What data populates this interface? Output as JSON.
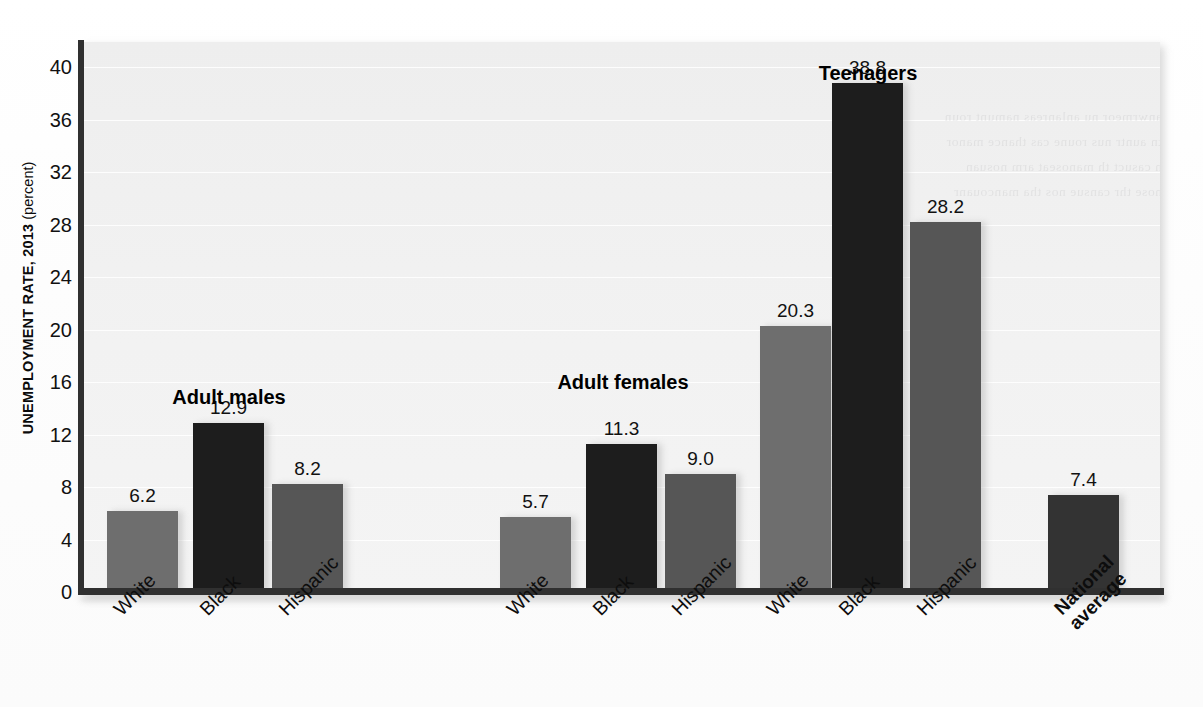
{
  "axis": {
    "y_title_strong": "UNEMPLOYMENT RATE, 2013",
    "y_title_light": " (percent)",
    "y_ticks": [
      "0",
      "4",
      "8",
      "12",
      "16",
      "20",
      "24",
      "28",
      "32",
      "36",
      "40"
    ]
  },
  "groups": [
    {
      "label": "Adult males"
    },
    {
      "label": "Adult females"
    },
    {
      "label": "Teenagers"
    },
    {
      "label": ""
    }
  ],
  "bars": [
    {
      "category": "White",
      "value": 6.2,
      "value_label": "6.2",
      "color": "#6e6e6e"
    },
    {
      "category": "Black",
      "value": 12.9,
      "value_label": "12.9",
      "color": "#1d1d1d"
    },
    {
      "category": "Hispanic",
      "value": 8.2,
      "value_label": "8.2",
      "color": "#565656"
    },
    {
      "category": "White",
      "value": 5.7,
      "value_label": "5.7",
      "color": "#6e6e6e"
    },
    {
      "category": "Black",
      "value": 11.3,
      "value_label": "11.3",
      "color": "#1d1d1d"
    },
    {
      "category": "Hispanic",
      "value": 9.0,
      "value_label": "9.0",
      "color": "#565656"
    },
    {
      "category": "White",
      "value": 20.3,
      "value_label": "20.3",
      "color": "#6e6e6e"
    },
    {
      "category": "Black",
      "value": 38.8,
      "value_label": "38.8",
      "color": "#1d1d1d"
    },
    {
      "category": "Hispanic",
      "value": 28.2,
      "value_label": "28.2",
      "color": "#565656"
    },
    {
      "category": "National\naverage",
      "value": 7.4,
      "value_label": "7.4",
      "color": "#333333"
    }
  ],
  "chart_data": {
    "type": "bar",
    "title": "",
    "xlabel": "",
    "ylabel": "UNEMPLOYMENT RATE, 2013 (percent)",
    "ylim": [
      0,
      44
    ],
    "ytick_step": 4,
    "grid": true,
    "legend": "none",
    "group_labels": [
      "Adult males",
      "Adult females",
      "Teenagers",
      "National average"
    ],
    "categories": [
      "Adult males / White",
      "Adult males / Black",
      "Adult males / Hispanic",
      "Adult females / White",
      "Adult females / Black",
      "Adult females / Hispanic",
      "Teenagers / White",
      "Teenagers / Black",
      "Teenagers / Hispanic",
      "National average"
    ],
    "tick_labels": [
      "White",
      "Black",
      "Hispanic",
      "White",
      "Black",
      "Hispanic",
      "White",
      "Black",
      "Hispanic",
      "National average"
    ],
    "values": [
      6.2,
      12.9,
      8.2,
      5.7,
      11.3,
      9.0,
      20.3,
      38.8,
      28.2,
      7.4
    ],
    "series": [
      {
        "name": "Unemployment rate 2013 (percent)",
        "values": [
          6.2,
          12.9,
          8.2,
          5.7,
          11.3,
          9.0,
          20.3,
          38.8,
          28.2,
          7.4
        ]
      }
    ],
    "data_labels": [
      "6.2",
      "12.9",
      "8.2",
      "5.7",
      "11.3",
      "9.0",
      "20.3",
      "38.8",
      "28.2",
      "7.4"
    ],
    "colors": {
      "white_bars": "#6e6e6e",
      "black_bars": "#1d1d1d",
      "hispanic_bars": "#565656",
      "national_average_bar": "#333333",
      "plot_background": "#f1f1f1",
      "axis": "#303030"
    }
  }
}
